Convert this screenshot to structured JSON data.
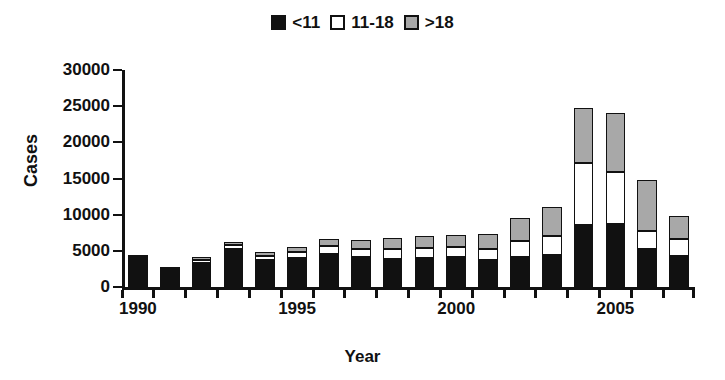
{
  "chart_data": {
    "type": "bar",
    "stacked": true,
    "title": "",
    "xlabel": "Year",
    "ylabel": "Cases",
    "ylim": [
      0,
      30000
    ],
    "yticks": [
      0,
      5000,
      10000,
      15000,
      20000,
      25000,
      30000
    ],
    "ytick_labels": [
      "0",
      "5000",
      "10000",
      "15000",
      "20000",
      "25000",
      "30000"
    ],
    "grid": false,
    "legend_position": "top-center",
    "categories": [
      "1990",
      "1991",
      "1992",
      "1993",
      "1994",
      "1995",
      "1996",
      "1997",
      "1998",
      "1999",
      "2000",
      "2001",
      "2002",
      "2003",
      "2004",
      "2005",
      "2006",
      "2007"
    ],
    "xtick_labels": [
      "1990",
      "1995",
      "2000",
      "2005"
    ],
    "xtick_categories": [
      "1990",
      "1995",
      "2000",
      "2005"
    ],
    "series": [
      {
        "name": "<11",
        "color": "#111111",
        "values": [
          4400,
          2800,
          3300,
          5300,
          3800,
          4000,
          4600,
          4200,
          3900,
          4000,
          4200,
          3700,
          4100,
          4400,
          8600,
          8700,
          5300,
          4300
        ]
      },
      {
        "name": "11-18",
        "color": "#ffffff",
        "values": [
          0,
          0,
          400,
          500,
          500,
          800,
          1100,
          1100,
          1300,
          1400,
          1400,
          1500,
          2300,
          2700,
          8500,
          7200,
          2500,
          2300
        ]
      },
      {
        "name": ">18",
        "color": "#a8a8a8",
        "values": [
          0,
          0,
          400,
          400,
          500,
          700,
          1000,
          1200,
          1600,
          1700,
          1600,
          2100,
          3100,
          4000,
          7700,
          8100,
          7000,
          3200
        ]
      }
    ],
    "totals": [
      4400,
      2800,
      4100,
      6200,
      4800,
      5500,
      6700,
      6500,
      6800,
      7100,
      7200,
      7300,
      9500,
      11100,
      24800,
      24000,
      14800,
      9800
    ]
  },
  "legend": {
    "entries": [
      {
        "label": "<11",
        "swatch": "black-square-icon"
      },
      {
        "label": "11-18",
        "swatch": "white-square-icon"
      },
      {
        "label": ">18",
        "swatch": "gray-square-icon"
      }
    ]
  },
  "axes": {
    "y_title": "Cases",
    "x_title": "Year"
  }
}
